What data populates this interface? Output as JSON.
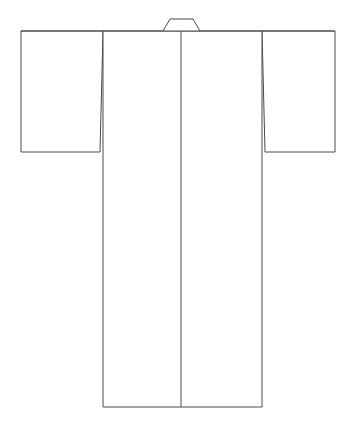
{
  "canvas": {
    "width": 356,
    "height": 423,
    "background_color": "#ffffff",
    "title": "Kimono Flat Technical Line Drawing"
  },
  "drawing": {
    "name": "kimono-flat-sketch",
    "subject": "kimono",
    "view": "front-flat",
    "style": "line-art",
    "fill_color": "#ffffff",
    "stroke_color": "#4a4a4a",
    "stroke_width": 1,
    "label": "",
    "annotations": []
  },
  "parts": {
    "collar": {
      "label": "collar",
      "points": "163,31 170,19 193,19 200,31",
      "description": "small trapezoidal neck band at top center"
    },
    "body": {
      "label": "body",
      "points": "103,31 262,31 262,407 103,407",
      "description": "long rectangular torso panel reaching to hem"
    },
    "left_sleeve": {
      "label": "left-sleeve",
      "points": "21,31 103,31 100,152 21,152",
      "description": "wide rectangular sleeve on viewer left"
    },
    "right_sleeve": {
      "label": "right-sleeve",
      "points": "262,31 335,31 335,152 265,152",
      "description": "wide rectangular sleeve on viewer right"
    },
    "center_front_seam": {
      "label": "center-front-seam",
      "points": "181,31 181,407",
      "description": "vertical seam line splitting the body panel"
    },
    "shoulder_line": {
      "label": "shoulder-line",
      "points": "21,31 335,31",
      "description": "horizontal top edge across shoulders and sleeves"
    },
    "hem_line": {
      "label": "hem-line",
      "points": "103,407 262,407",
      "description": "bottom hem of the body panel"
    }
  },
  "geometry": {
    "shoulder_y": 31,
    "hem_y": 407,
    "sleeve_bottom_y": 152,
    "collar_top_y": 19,
    "body_left_x": 103,
    "body_right_x": 262,
    "center_x": 181,
    "left_sleeve_outer_x": 21,
    "right_sleeve_outer_x": 335,
    "collar_base_left_x": 163,
    "collar_base_right_x": 200,
    "collar_top_left_x": 170,
    "collar_top_right_x": 193
  }
}
